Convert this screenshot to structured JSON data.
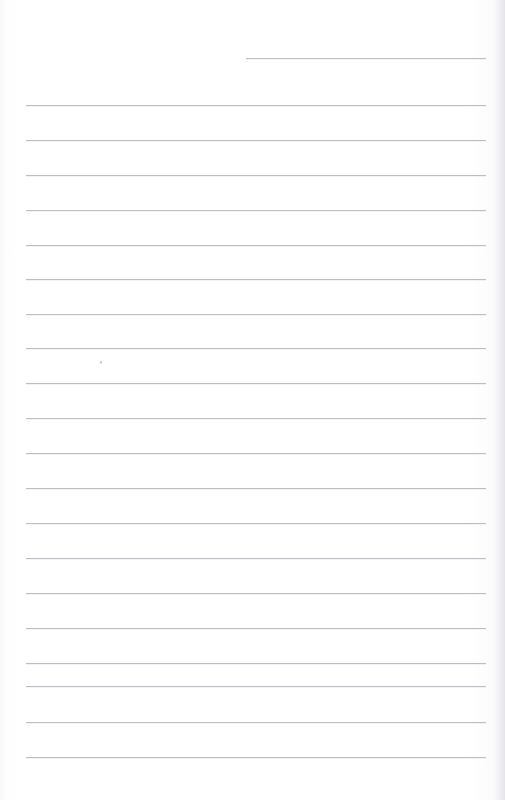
{
  "page": {
    "kind": "scanned-ruled-paper",
    "width_px": 505,
    "height_px": 800,
    "background_color": "#ffffff",
    "rule_color": "#b6b6bb",
    "edge_shadow_color": "#d6d6dd",
    "written_text": "",
    "note": ""
  },
  "rules": [
    {
      "id": "date-rule",
      "label": "date line",
      "y": 58,
      "x": 246,
      "width": 240,
      "tone": "soft"
    },
    {
      "id": "rule-01",
      "label": "line 1",
      "y": 105,
      "x": 26,
      "width": 460,
      "tone": "soft"
    },
    {
      "id": "rule-02",
      "label": "line 2",
      "y": 140,
      "x": 26,
      "width": 460,
      "tone": "soft"
    },
    {
      "id": "rule-03",
      "label": "line 3",
      "y": 175,
      "x": 26,
      "width": 460,
      "tone": "soft"
    },
    {
      "id": "rule-04",
      "label": "line 4",
      "y": 210,
      "x": 26,
      "width": 460,
      "tone": "soft"
    },
    {
      "id": "rule-05",
      "label": "line 5",
      "y": 245,
      "x": 26,
      "width": 460,
      "tone": "soft"
    },
    {
      "id": "rule-06",
      "label": "line 6",
      "y": 279,
      "x": 26,
      "width": 460,
      "tone": "soft"
    },
    {
      "id": "rule-07",
      "label": "line 7",
      "y": 314,
      "x": 26,
      "width": 460,
      "tone": "soft"
    },
    {
      "id": "rule-08",
      "label": "line 8",
      "y": 348,
      "x": 26,
      "width": 460,
      "tone": "soft"
    },
    {
      "id": "rule-09",
      "label": "line 9",
      "y": 383,
      "x": 26,
      "width": 460,
      "tone": "soft"
    },
    {
      "id": "rule-10",
      "label": "line 10",
      "y": 418,
      "x": 26,
      "width": 460,
      "tone": "soft"
    },
    {
      "id": "rule-11",
      "label": "line 11",
      "y": 453,
      "x": 26,
      "width": 460,
      "tone": "soft"
    },
    {
      "id": "rule-12",
      "label": "line 12",
      "y": 488,
      "x": 26,
      "width": 460,
      "tone": "soft"
    },
    {
      "id": "rule-13",
      "label": "line 13",
      "y": 523,
      "x": 26,
      "width": 460,
      "tone": "soft"
    },
    {
      "id": "rule-14",
      "label": "line 14",
      "y": 558,
      "x": 26,
      "width": 460,
      "tone": "soft"
    },
    {
      "id": "rule-15",
      "label": "line 15",
      "y": 593,
      "x": 26,
      "width": 460,
      "tone": "soft"
    },
    {
      "id": "rule-16",
      "label": "line 16",
      "y": 628,
      "x": 26,
      "width": 460,
      "tone": "soft"
    },
    {
      "id": "rule-17",
      "label": "line 17",
      "y": 663,
      "x": 26,
      "width": 460,
      "tone": "soft"
    },
    {
      "id": "rule-18",
      "label": "line 18",
      "y": 686,
      "x": 26,
      "width": 460,
      "tone": "soft"
    },
    {
      "id": "rule-19",
      "label": "line 19",
      "y": 722,
      "x": 26,
      "width": 460,
      "tone": "soft"
    },
    {
      "id": "rule-20",
      "label": "line 20",
      "y": 757,
      "x": 26,
      "width": 460,
      "tone": "soft"
    }
  ],
  "marks": [
    {
      "id": "speck-1",
      "label": "scan speck",
      "x": 100,
      "y": 361
    }
  ]
}
